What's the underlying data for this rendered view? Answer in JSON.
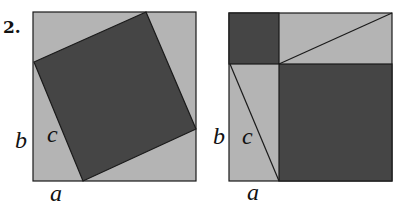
{
  "figure": {
    "number": "2.",
    "colors": {
      "light": "#b4b4b4",
      "dark": "#454545",
      "stroke": "#1a1a1a",
      "background": "#ffffff"
    },
    "left_diagram": {
      "labels": {
        "b": "b",
        "c": "c",
        "a": "a"
      },
      "description": "Outer square (a+b) with inscribed tilted dark square of side c and four light right triangles"
    },
    "right_diagram": {
      "labels": {
        "b": "b",
        "c": "c",
        "a": "a"
      },
      "description": "Outer square (a+b) split into dark a×a square, dark b×b square, and two light rectangles each cut by a diagonal c"
    }
  }
}
